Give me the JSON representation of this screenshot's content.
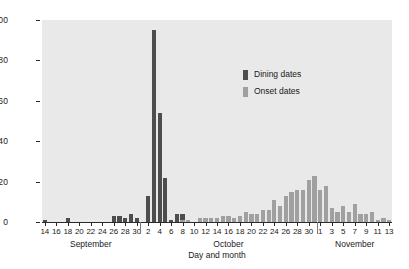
{
  "chart_data": {
    "type": "bar",
    "title": "",
    "xlabel": "Day and month",
    "ylabel": "Number",
    "ylim": [
      0,
      100
    ],
    "ytick_values": [
      0,
      20,
      40,
      60,
      80,
      100
    ],
    "grid": false,
    "legend_position": "upper-center-right",
    "plot_background": "#e9e9e9",
    "series": [
      {
        "name": "Dining dates",
        "color": "#4d4d4d",
        "values": [
          1,
          0,
          0,
          0,
          2,
          0,
          0,
          0,
          0,
          0,
          0,
          0,
          3,
          3,
          2,
          4,
          2,
          0,
          13,
          95,
          54,
          22,
          1,
          4,
          4,
          1,
          0,
          0,
          0,
          0,
          0,
          0,
          0,
          0,
          0,
          0,
          0,
          0,
          0,
          0,
          0,
          0,
          0,
          0,
          0,
          0,
          0,
          0,
          0,
          0,
          0,
          0,
          0,
          0,
          0,
          0,
          0,
          0,
          0,
          0,
          0
        ]
      },
      {
        "name": "Onset dates",
        "color": "#a0a0a0",
        "values": [
          0,
          0,
          0,
          0,
          0,
          0,
          0,
          0,
          0,
          0,
          0,
          0,
          0,
          0,
          0,
          0,
          0,
          0,
          0,
          0,
          0,
          0,
          0,
          0,
          1,
          1,
          0,
          2,
          2,
          2,
          2,
          3,
          3,
          2,
          3,
          5,
          4,
          4,
          6,
          6,
          11,
          8,
          13,
          15,
          16,
          16,
          21,
          23,
          16,
          18,
          7,
          5,
          8,
          5,
          9,
          4,
          4,
          5,
          1,
          2,
          1
        ]
      }
    ],
    "x": [
      {
        "day": "14",
        "month": "September",
        "tick": true
      },
      {
        "day": "15",
        "month": "September",
        "tick": false
      },
      {
        "day": "16",
        "month": "September",
        "tick": true
      },
      {
        "day": "17",
        "month": "September",
        "tick": false
      },
      {
        "day": "18",
        "month": "September",
        "tick": true
      },
      {
        "day": "19",
        "month": "September",
        "tick": false
      },
      {
        "day": "20",
        "month": "September",
        "tick": true
      },
      {
        "day": "21",
        "month": "September",
        "tick": false
      },
      {
        "day": "22",
        "month": "September",
        "tick": true
      },
      {
        "day": "23",
        "month": "September",
        "tick": false
      },
      {
        "day": "24",
        "month": "September",
        "tick": true
      },
      {
        "day": "25",
        "month": "September",
        "tick": false
      },
      {
        "day": "26",
        "month": "September",
        "tick": true
      },
      {
        "day": "27",
        "month": "September",
        "tick": false
      },
      {
        "day": "28",
        "month": "September",
        "tick": true
      },
      {
        "day": "29",
        "month": "September",
        "tick": false
      },
      {
        "day": "30",
        "month": "September",
        "tick": true
      },
      {
        "day": "1",
        "month": "October",
        "tick": false
      },
      {
        "day": "2",
        "month": "October",
        "tick": true
      },
      {
        "day": "3",
        "month": "October",
        "tick": false
      },
      {
        "day": "4",
        "month": "October",
        "tick": true
      },
      {
        "day": "5",
        "month": "October",
        "tick": false
      },
      {
        "day": "6",
        "month": "October",
        "tick": true
      },
      {
        "day": "7",
        "month": "October",
        "tick": false
      },
      {
        "day": "8",
        "month": "October",
        "tick": true
      },
      {
        "day": "9",
        "month": "October",
        "tick": false
      },
      {
        "day": "10",
        "month": "October",
        "tick": true
      },
      {
        "day": "11",
        "month": "October",
        "tick": false
      },
      {
        "day": "12",
        "month": "October",
        "tick": true
      },
      {
        "day": "13",
        "month": "October",
        "tick": false
      },
      {
        "day": "14",
        "month": "October",
        "tick": true
      },
      {
        "day": "15",
        "month": "October",
        "tick": false
      },
      {
        "day": "16",
        "month": "October",
        "tick": true
      },
      {
        "day": "17",
        "month": "October",
        "tick": false
      },
      {
        "day": "18",
        "month": "October",
        "tick": true
      },
      {
        "day": "19",
        "month": "October",
        "tick": false
      },
      {
        "day": "20",
        "month": "October",
        "tick": true
      },
      {
        "day": "21",
        "month": "October",
        "tick": false
      },
      {
        "day": "22",
        "month": "October",
        "tick": true
      },
      {
        "day": "23",
        "month": "October",
        "tick": false
      },
      {
        "day": "24",
        "month": "October",
        "tick": true
      },
      {
        "day": "25",
        "month": "October",
        "tick": false
      },
      {
        "day": "26",
        "month": "October",
        "tick": true
      },
      {
        "day": "27",
        "month": "October",
        "tick": false
      },
      {
        "day": "28",
        "month": "October",
        "tick": true
      },
      {
        "day": "29",
        "month": "October",
        "tick": false
      },
      {
        "day": "30",
        "month": "October",
        "tick": true
      },
      {
        "day": "31",
        "month": "October",
        "tick": false
      },
      {
        "day": "1",
        "month": "November",
        "tick": true
      },
      {
        "day": "2",
        "month": "November",
        "tick": false
      },
      {
        "day": "3",
        "month": "November",
        "tick": true
      },
      {
        "day": "4",
        "month": "November",
        "tick": false
      },
      {
        "day": "5",
        "month": "November",
        "tick": true
      },
      {
        "day": "6",
        "month": "November",
        "tick": false
      },
      {
        "day": "7",
        "month": "November",
        "tick": true
      },
      {
        "day": "8",
        "month": "November",
        "tick": false
      },
      {
        "day": "9",
        "month": "November",
        "tick": true
      },
      {
        "day": "10",
        "month": "November",
        "tick": false
      },
      {
        "day": "11",
        "month": "November",
        "tick": true
      },
      {
        "day": "12",
        "month": "November",
        "tick": false
      },
      {
        "day": "13",
        "month": "November",
        "tick": true
      }
    ],
    "month_labels": [
      "September",
      "October",
      "November"
    ]
  },
  "legend": {
    "items": [
      {
        "label": "Dining dates",
        "color": "#4d4d4d"
      },
      {
        "label": "Onset dates",
        "color": "#a0a0a0"
      }
    ]
  }
}
